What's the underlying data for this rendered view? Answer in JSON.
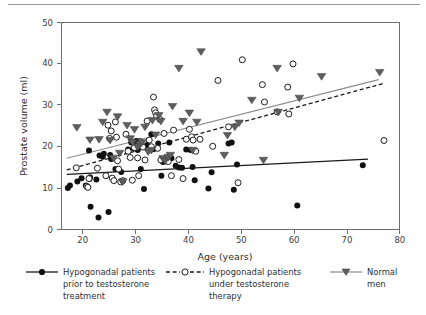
{
  "chart_data": {
    "type": "scatter",
    "title": "",
    "xlabel": "Age (years)",
    "ylabel": "Prostate volume (ml)",
    "xlim": [
      16,
      80
    ],
    "ylim": [
      0,
      50
    ],
    "xticks": [
      20,
      30,
      40,
      50,
      60,
      70,
      80
    ],
    "yticks": [
      0,
      10,
      20,
      30,
      40,
      50
    ],
    "grid": false,
    "legend_position": "below-plot",
    "series": [
      {
        "name": "Hypogonadal patients prior to testosterone treatment",
        "marker": "filled-circle",
        "color": "#101010",
        "line_style": "solid",
        "line_color": "#1a1a1a",
        "trend": {
          "x0": 17,
          "y0": 13.3,
          "x1": 74,
          "y1": 17.0
        },
        "points": [
          [
            17.2,
            10.0
          ],
          [
            17.6,
            10.6
          ],
          [
            19.0,
            11.6
          ],
          [
            19.8,
            12.4
          ],
          [
            20.6,
            10.6
          ],
          [
            21.2,
            19.1
          ],
          [
            21.3,
            12.2
          ],
          [
            21.4,
            12.6
          ],
          [
            21.5,
            5.5
          ],
          [
            22.6,
            12.1
          ],
          [
            23.0,
            2.9
          ],
          [
            23.2,
            17.9
          ],
          [
            23.8,
            17.6
          ],
          [
            24.0,
            18.3
          ],
          [
            24.9,
            4.2
          ],
          [
            25.2,
            18.0
          ],
          [
            25.4,
            17.0
          ],
          [
            26.2,
            14.6
          ],
          [
            27.3,
            13.9
          ],
          [
            28.6,
            19.3
          ],
          [
            29.2,
            21.0
          ],
          [
            29.6,
            19.6
          ],
          [
            30.1,
            21.4
          ],
          [
            30.4,
            19.2
          ],
          [
            30.8,
            21.3
          ],
          [
            31.0,
            14.6
          ],
          [
            31.6,
            9.8
          ],
          [
            32.2,
            20.4
          ],
          [
            33.0,
            23.0
          ],
          [
            33.4,
            19.4
          ],
          [
            34.3,
            20.8
          ],
          [
            34.9,
            13.0
          ],
          [
            35.2,
            16.3
          ],
          [
            35.8,
            16.6
          ],
          [
            36.4,
            21.0
          ],
          [
            36.8,
            17.2
          ],
          [
            37.6,
            15.4
          ],
          [
            38.2,
            15.0
          ],
          [
            38.8,
            14.9
          ],
          [
            39.6,
            19.3
          ],
          [
            40.4,
            19.2
          ],
          [
            40.8,
            15.1
          ],
          [
            41.2,
            11.9
          ],
          [
            43.8,
            9.9
          ],
          [
            44.4,
            13.8
          ],
          [
            47.6,
            20.8
          ],
          [
            48.2,
            21.0
          ],
          [
            48.6,
            9.6
          ],
          [
            49.2,
            15.7
          ],
          [
            60.6,
            5.8
          ],
          [
            73.0,
            15.5
          ]
        ]
      },
      {
        "name": "Hypogonadal patients under testosterone therapy",
        "marker": "open-circle",
        "color": "#1d1d1d",
        "line_style": "dashed",
        "line_color": "#1a1a1a",
        "trend": {
          "x0": 17,
          "y0": 14.4,
          "x1": 77,
          "y1": 35.3
        },
        "points": [
          [
            18.8,
            14.9
          ],
          [
            20.8,
            10.4
          ],
          [
            21.0,
            10.2
          ],
          [
            21.2,
            12.3
          ],
          [
            22.8,
            14.8
          ],
          [
            24.4,
            13.0
          ],
          [
            24.8,
            25.2
          ],
          [
            25.1,
            22.0
          ],
          [
            25.4,
            23.8
          ],
          [
            25.6,
            12.4
          ],
          [
            25.9,
            11.8
          ],
          [
            26.2,
            26.0
          ],
          [
            26.4,
            22.3
          ],
          [
            26.6,
            16.6
          ],
          [
            26.8,
            14.6
          ],
          [
            27.2,
            11.5
          ],
          [
            27.6,
            11.8
          ],
          [
            28.2,
            23.0
          ],
          [
            28.6,
            18.9
          ],
          [
            29.0,
            17.4
          ],
          [
            29.4,
            11.9
          ],
          [
            29.8,
            19.8
          ],
          [
            30.4,
            17.3
          ],
          [
            30.6,
            13.0
          ],
          [
            31.0,
            21.2
          ],
          [
            31.4,
            19.9
          ],
          [
            31.8,
            16.8
          ],
          [
            32.2,
            26.2
          ],
          [
            32.6,
            21.6
          ],
          [
            33.0,
            20.0
          ],
          [
            33.4,
            32.0
          ],
          [
            33.6,
            28.9
          ],
          [
            33.8,
            28.2
          ],
          [
            34.0,
            27.4
          ],
          [
            34.2,
            19.6
          ],
          [
            34.6,
            26.6
          ],
          [
            34.8,
            16.8
          ],
          [
            35.4,
            23.2
          ],
          [
            35.6,
            17.0
          ],
          [
            36.2,
            16.4
          ],
          [
            36.8,
            13.0
          ],
          [
            37.2,
            24.0
          ],
          [
            38.2,
            16.9
          ],
          [
            39.0,
            12.3
          ],
          [
            39.6,
            21.8
          ],
          [
            40.2,
            24.2
          ],
          [
            40.6,
            22.4
          ],
          [
            40.9,
            21.6
          ],
          [
            41.4,
            18.9
          ],
          [
            42.2,
            21.8
          ],
          [
            44.6,
            20.1
          ],
          [
            45.6,
            36.0
          ],
          [
            47.6,
            24.8
          ],
          [
            49.4,
            11.3
          ],
          [
            50.2,
            41.0
          ],
          [
            54.0,
            35.0
          ],
          [
            54.4,
            30.8
          ],
          [
            56.8,
            28.4
          ],
          [
            58.8,
            34.4
          ],
          [
            59.0,
            27.9
          ],
          [
            59.8,
            40.0
          ],
          [
            77.0,
            21.5
          ]
        ]
      },
      {
        "name": "Normal men",
        "marker": "down-triangle",
        "color": "#5e5e5e",
        "line_style": "solid",
        "line_color": "#8b8b8b",
        "trend": {
          "x0": 17,
          "y0": 17.2,
          "x1": 76,
          "y1": 36.2
        },
        "points": [
          [
            18.9,
            24.7
          ],
          [
            21.4,
            21.7
          ],
          [
            23.1,
            21.8
          ],
          [
            23.8,
            26.0
          ],
          [
            24.6,
            28.4
          ],
          [
            25.2,
            21.6
          ],
          [
            25.8,
            17.3
          ],
          [
            26.6,
            27.3
          ],
          [
            27.0,
            18.5
          ],
          [
            27.6,
            11.6
          ],
          [
            28.4,
            25.2
          ],
          [
            29.0,
            22.0
          ],
          [
            29.4,
            21.1
          ],
          [
            29.8,
            24.2
          ],
          [
            30.4,
            19.9
          ],
          [
            30.8,
            20.6
          ],
          [
            31.2,
            21.0
          ],
          [
            31.8,
            24.8
          ],
          [
            32.4,
            18.8
          ],
          [
            33.0,
            19.2
          ],
          [
            33.2,
            26.4
          ],
          [
            33.8,
            22.9
          ],
          [
            34.4,
            27.6
          ],
          [
            34.8,
            26.2
          ],
          [
            35.2,
            17.2
          ],
          [
            35.6,
            16.6
          ],
          [
            36.2,
            17.5
          ],
          [
            36.6,
            18.0
          ],
          [
            37.0,
            29.8
          ],
          [
            38.2,
            39.0
          ],
          [
            39.0,
            26.2
          ],
          [
            40.2,
            28.2
          ],
          [
            40.8,
            19.2
          ],
          [
            41.6,
            26.0
          ],
          [
            42.4,
            43.0
          ],
          [
            46.8,
            18.0
          ],
          [
            47.4,
            22.8
          ],
          [
            48.8,
            24.8
          ],
          [
            49.6,
            25.8
          ],
          [
            52.0,
            31.3
          ],
          [
            54.2,
            16.8
          ],
          [
            56.8,
            39.0
          ],
          [
            57.0,
            28.4
          ],
          [
            61.0,
            31.8
          ],
          [
            65.2,
            37.0
          ],
          [
            76.2,
            38.0
          ]
        ]
      }
    ]
  },
  "axes": {
    "x_title": "Age (years)",
    "y_title": "Prostate volume (ml)",
    "x_tick_labels": [
      "20",
      "30",
      "40",
      "50",
      "60",
      "70",
      "80"
    ],
    "y_tick_labels": [
      "0",
      "10",
      "20",
      "30",
      "40",
      "50"
    ]
  },
  "legend": {
    "entries": [
      {
        "key": "hypogonadal-prior",
        "line1": "Hypogonadal patients",
        "line2": "prior to testosterone",
        "line3": "treatment",
        "marker": "filled-circle",
        "line_style": "solid"
      },
      {
        "key": "hypogonadal-under",
        "line1": "Hypogonadal patients",
        "line2": "under testosterone",
        "line3": "therapy",
        "marker": "open-circle",
        "line_style": "dashed"
      },
      {
        "key": "normal-men",
        "line1": "Normal",
        "line2": "men",
        "line3": "",
        "marker": "down-triangle",
        "line_style": "solid-gray"
      }
    ]
  },
  "colors": {
    "axis": "#6d6d6d",
    "text": "#2e2e2e",
    "filled_marker": "#101010",
    "open_marker_stroke": "#1d1d1d",
    "triangle_marker": "#5e5e5e",
    "gray_line": "#8b8b8b",
    "black_line": "#1a1a1a",
    "top_rule": "#9a9a9a"
  }
}
